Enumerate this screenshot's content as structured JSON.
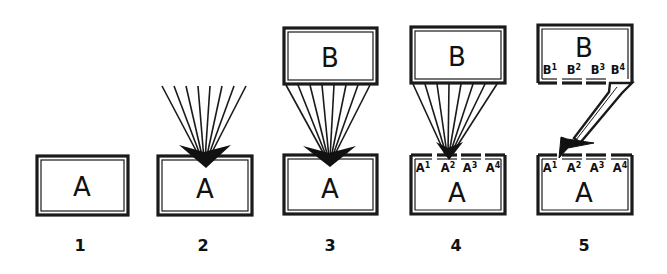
{
  "diagram": {
    "panels": [
      {
        "number": "1",
        "lower_box": {
          "label": "A"
        }
      },
      {
        "number": "2",
        "lower_box": {
          "label": "A"
        },
        "incoming": "fan of converging lines from above into arrowhead"
      },
      {
        "number": "3",
        "upper_box": {
          "label": "B"
        },
        "lower_box": {
          "label": "A"
        },
        "incoming": "fan of lines from B converging into A"
      },
      {
        "number": "4",
        "upper_box": {
          "label": "B"
        },
        "lower_box": {
          "label": "A",
          "sublabels": [
            {
              "base": "A",
              "sup": "1"
            },
            {
              "base": "A",
              "sup": "2"
            },
            {
              "base": "A",
              "sup": "3"
            },
            {
              "base": "A",
              "sup": "4"
            }
          ]
        },
        "incoming": "fan of lines from B converging into A2"
      },
      {
        "number": "5",
        "upper_box": {
          "label": "B",
          "sublabels": [
            {
              "base": "B",
              "sup": "1"
            },
            {
              "base": "B",
              "sup": "2"
            },
            {
              "base": "B",
              "sup": "3"
            },
            {
              "base": "B",
              "sup": "4"
            }
          ]
        },
        "lower_box": {
          "label": "A",
          "sublabels": [
            {
              "base": "A",
              "sup": "1"
            },
            {
              "base": "A",
              "sup": "2"
            },
            {
              "base": "A",
              "sup": "3"
            },
            {
              "base": "A",
              "sup": "4"
            }
          ]
        },
        "incoming": "single thick arrow from B4 to A2"
      }
    ],
    "colors": {
      "ink": "#1a1a1a",
      "background": "#ffffff"
    }
  }
}
